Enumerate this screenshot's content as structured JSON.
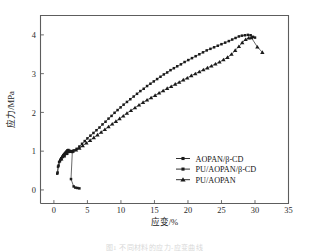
{
  "figure": {
    "caption_fragment": "图1  不同材料的应力-应变曲线"
  },
  "chart_data": {
    "type": "scatter",
    "title": "",
    "xlabel": "应变/%",
    "ylabel": "应力/MPa",
    "xlim": [
      -2,
      35
    ],
    "ylim": [
      -0.35,
      4.5
    ],
    "xticks": [
      0,
      5,
      10,
      15,
      20,
      25,
      30,
      35
    ],
    "yticks": [
      0,
      1,
      2,
      3,
      4
    ],
    "grid": false,
    "legend_position": "center-right",
    "series": [
      {
        "name": "AOPAN/β-CD",
        "marker": "square",
        "color": "#1a1a1a",
        "points": [
          [
            0.55,
            0.45
          ],
          [
            0.62,
            0.6
          ],
          [
            0.78,
            0.72
          ],
          [
            0.95,
            0.78
          ],
          [
            1.1,
            0.82
          ],
          [
            1.25,
            0.86
          ],
          [
            1.4,
            0.9
          ],
          [
            1.55,
            0.93
          ],
          [
            1.7,
            0.96
          ],
          [
            1.85,
            0.99
          ],
          [
            2.0,
            1.02
          ],
          [
            2.15,
            1.03
          ],
          [
            2.3,
            1.01
          ],
          [
            2.45,
            1.0
          ],
          [
            2.6,
            0.99
          ],
          [
            2.75,
            0.98
          ],
          [
            2.55,
            0.28
          ],
          [
            2.95,
            0.09
          ],
          [
            3.2,
            0.06
          ],
          [
            3.5,
            0.05
          ],
          [
            3.8,
            0.04
          ]
        ]
      },
      {
        "name": "PU/AOPAN/β-CD",
        "marker": "square",
        "color": "#1a1a1a",
        "points": [
          [
            0.5,
            0.42
          ],
          [
            0.7,
            0.63
          ],
          [
            0.9,
            0.74
          ],
          [
            1.1,
            0.8
          ],
          [
            1.35,
            0.85
          ],
          [
            1.6,
            0.89
          ],
          [
            1.85,
            0.93
          ],
          [
            2.1,
            0.97
          ],
          [
            2.35,
            1.0
          ],
          [
            2.7,
            1.0
          ],
          [
            3.0,
            1.02
          ],
          [
            3.4,
            1.06
          ],
          [
            3.8,
            1.12
          ],
          [
            4.2,
            1.19
          ],
          [
            4.6,
            1.26
          ],
          [
            5.0,
            1.33
          ],
          [
            5.45,
            1.4
          ],
          [
            5.9,
            1.47
          ],
          [
            6.35,
            1.54
          ],
          [
            6.8,
            1.61
          ],
          [
            7.25,
            1.69
          ],
          [
            7.7,
            1.76
          ],
          [
            8.15,
            1.84
          ],
          [
            8.6,
            1.91
          ],
          [
            9.05,
            1.99
          ],
          [
            9.5,
            2.06
          ],
          [
            9.95,
            2.13
          ],
          [
            10.4,
            2.2
          ],
          [
            10.9,
            2.27
          ],
          [
            11.4,
            2.34
          ],
          [
            11.9,
            2.41
          ],
          [
            12.4,
            2.48
          ],
          [
            12.9,
            2.55
          ],
          [
            13.4,
            2.61
          ],
          [
            13.9,
            2.68
          ],
          [
            14.4,
            2.74
          ],
          [
            14.9,
            2.8
          ],
          [
            15.4,
            2.86
          ],
          [
            15.9,
            2.92
          ],
          [
            16.4,
            2.98
          ],
          [
            16.9,
            3.03
          ],
          [
            17.4,
            3.09
          ],
          [
            17.9,
            3.14
          ],
          [
            18.4,
            3.19
          ],
          [
            18.95,
            3.24
          ],
          [
            19.5,
            3.3
          ],
          [
            20.05,
            3.35
          ],
          [
            20.6,
            3.4
          ],
          [
            21.15,
            3.45
          ],
          [
            21.7,
            3.5
          ],
          [
            22.25,
            3.55
          ],
          [
            22.8,
            3.6
          ],
          [
            23.35,
            3.64
          ],
          [
            23.9,
            3.68
          ],
          [
            24.45,
            3.72
          ],
          [
            25.0,
            3.76
          ],
          [
            25.55,
            3.8
          ],
          [
            26.1,
            3.84
          ],
          [
            26.6,
            3.88
          ],
          [
            27.1,
            3.92
          ],
          [
            27.6,
            3.96
          ],
          [
            28.05,
            3.98
          ],
          [
            28.5,
            3.99
          ],
          [
            28.95,
            4.0
          ],
          [
            29.35,
            3.99
          ],
          [
            29.7,
            3.95
          ],
          [
            30.0,
            3.93
          ]
        ]
      },
      {
        "name": "PU/AOPAN",
        "marker": "triangle",
        "color": "#1a1a1a",
        "points": [
          [
            1.1,
            0.8
          ],
          [
            1.5,
            0.88
          ],
          [
            1.9,
            0.94
          ],
          [
            2.3,
            0.99
          ],
          [
            2.8,
            1.0
          ],
          [
            3.3,
            1.03
          ],
          [
            3.8,
            1.08
          ],
          [
            4.3,
            1.14
          ],
          [
            4.85,
            1.21
          ],
          [
            5.4,
            1.28
          ],
          [
            5.95,
            1.35
          ],
          [
            6.5,
            1.42
          ],
          [
            7.05,
            1.49
          ],
          [
            7.6,
            1.56
          ],
          [
            8.15,
            1.63
          ],
          [
            8.7,
            1.7
          ],
          [
            9.25,
            1.77
          ],
          [
            9.8,
            1.84
          ],
          [
            10.35,
            1.91
          ],
          [
            10.9,
            1.98
          ],
          [
            11.5,
            2.05
          ],
          [
            12.1,
            2.12
          ],
          [
            12.7,
            2.19
          ],
          [
            13.3,
            2.26
          ],
          [
            13.9,
            2.32
          ],
          [
            14.5,
            2.38
          ],
          [
            15.1,
            2.44
          ],
          [
            15.7,
            2.5
          ],
          [
            16.3,
            2.56
          ],
          [
            16.9,
            2.62
          ],
          [
            17.5,
            2.67
          ],
          [
            18.1,
            2.73
          ],
          [
            18.7,
            2.78
          ],
          [
            19.3,
            2.84
          ],
          [
            19.9,
            2.89
          ],
          [
            20.5,
            2.95
          ],
          [
            21.1,
            3.0
          ],
          [
            21.7,
            3.05
          ],
          [
            22.3,
            3.1
          ],
          [
            22.9,
            3.15
          ],
          [
            23.5,
            3.2
          ],
          [
            24.1,
            3.25
          ],
          [
            24.7,
            3.3
          ],
          [
            25.3,
            3.36
          ],
          [
            25.9,
            3.42
          ],
          [
            26.5,
            3.5
          ],
          [
            27.05,
            3.6
          ],
          [
            27.6,
            3.7
          ],
          [
            28.1,
            3.8
          ],
          [
            28.6,
            3.88
          ],
          [
            29.05,
            3.92
          ],
          [
            29.45,
            3.93
          ],
          [
            30.35,
            3.69
          ],
          [
            31.1,
            3.55
          ]
        ]
      }
    ]
  },
  "axes": {
    "x_tick_labels": [
      "0",
      "5",
      "10",
      "15",
      "20",
      "25",
      "30",
      "35"
    ],
    "y_tick_labels": [
      "0",
      "1",
      "2",
      "3",
      "4"
    ],
    "x_title": "应变/%",
    "y_title": "应力/MPa"
  },
  "legend": {
    "entries": [
      {
        "label": "AOPAN/β-CD",
        "marker": "square"
      },
      {
        "label": "PU/AOPAN/β-CD",
        "marker": "square"
      },
      {
        "label": "PU/AOPAN",
        "marker": "triangle"
      }
    ]
  }
}
